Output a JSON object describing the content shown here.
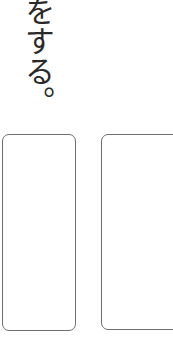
{
  "text": {
    "vertical_line": "をする。"
  },
  "answer_boxes": [
    {
      "id": "left",
      "value": ""
    },
    {
      "id": "right",
      "value": ""
    }
  ],
  "colors": {
    "text": "#2a2a2a",
    "box_border": "#6e6e6e",
    "background": "#ffffff"
  }
}
